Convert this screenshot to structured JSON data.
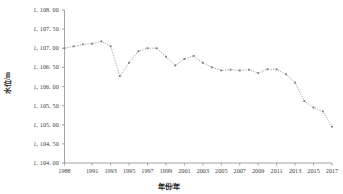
{
  "chart_data": {
    "type": "line",
    "title": "",
    "xlabel": "年份/年",
    "ylabel": "水位/m",
    "ylim": [
      1104.0,
      1108.0
    ],
    "ytick_labels": [
      "1, 108. 00",
      "1, 107. 50",
      "1, 107. 00",
      "1, 106. 50",
      "1, 106. 00",
      "1, 105. 50",
      "1, 105. 00",
      "1, 104. 50",
      "1, 104. 00"
    ],
    "yticks": [
      1108.0,
      1107.5,
      1107.0,
      1106.5,
      1106.0,
      1105.5,
      1105.0,
      1104.5,
      1104.0
    ],
    "xtick_labels": [
      "1988",
      "1991",
      "1993",
      "1995",
      "1997",
      "1999",
      "2001",
      "2003",
      "2005",
      "2007",
      "2009",
      "2011",
      "2013",
      "2015",
      "2017"
    ],
    "xticks": [
      1988,
      1991,
      1993,
      1995,
      1997,
      1999,
      2001,
      2003,
      2005,
      2007,
      2009,
      2011,
      2013,
      2015,
      2017
    ],
    "xlim": [
      1988,
      2017
    ],
    "grid": false,
    "legend": false,
    "line_style": "dotted",
    "marker": "square",
    "series_color": "#8c8c8c",
    "x": [
      1988,
      1989,
      1990,
      1991,
      1992,
      1993,
      1994,
      1995,
      1996,
      1997,
      1998,
      1999,
      2000,
      2001,
      2002,
      2003,
      2004,
      2005,
      2006,
      2007,
      2008,
      2009,
      2010,
      2011,
      2012,
      2013,
      2014,
      2015,
      2016,
      2017
    ],
    "values": [
      1107.0,
      1107.05,
      1107.1,
      1107.12,
      1107.18,
      1107.05,
      1106.27,
      1106.62,
      1106.92,
      1107.0,
      1107.0,
      1106.78,
      1106.55,
      1106.72,
      1106.8,
      1106.62,
      1106.5,
      1106.42,
      1106.44,
      1106.42,
      1106.44,
      1106.35,
      1106.45,
      1106.45,
      1106.32,
      1106.1,
      1105.62,
      1105.45,
      1105.35,
      1104.95
    ]
  }
}
